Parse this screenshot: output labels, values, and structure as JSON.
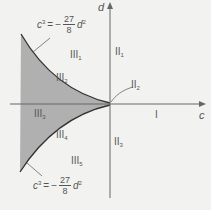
{
  "axes": {
    "x_label": "c",
    "y_label": "d"
  },
  "equations": {
    "top": {
      "lhs": "c",
      "lhs_exp": "3",
      "eq": "=",
      "sign": "−",
      "num": "27",
      "den": "8",
      "var": "d",
      "var_exp": "2"
    },
    "bottom": {
      "lhs": "c",
      "lhs_exp": "3",
      "eq": "=",
      "sign": "−",
      "num": "27",
      "den": "8",
      "var": "d",
      "var_exp": "2"
    }
  },
  "regions": {
    "I": {
      "base": "I",
      "sub": ""
    },
    "II1": {
      "base": "II",
      "sub": "1"
    },
    "II2": {
      "base": "II",
      "sub": "2"
    },
    "II3": {
      "base": "II",
      "sub": "3"
    },
    "III1": {
      "base": "III",
      "sub": "1"
    },
    "III2": {
      "base": "III",
      "sub": "2"
    },
    "III3": {
      "base": "III",
      "sub": "3"
    },
    "III4": {
      "base": "III",
      "sub": "4"
    },
    "III5": {
      "base": "III",
      "sub": "5"
    }
  },
  "colors": {
    "background": "#f2f2f0",
    "shade": "#b0b0b0",
    "axis": "#666666",
    "curve": "#333333"
  }
}
